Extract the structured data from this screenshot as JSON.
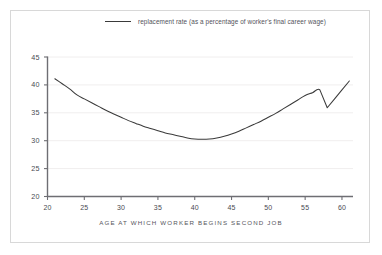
{
  "figure": {
    "border_color": "#d8d8d8",
    "background": "#ffffff"
  },
  "legend": {
    "position": "top-center",
    "swatch_icon": "line-swatch",
    "label": "replacement rate (as a percentage of worker's final career wage)",
    "line_color": "#3a3a3a"
  },
  "axes": {
    "xlabel": "AGE AT WHICH WORKER BEGINS SECOND JOB",
    "ylabel": "",
    "x_ticks": [
      "20",
      "25",
      "30",
      "35",
      "40",
      "45",
      "50",
      "55",
      "60"
    ],
    "y_ticks": [
      "20",
      "25",
      "30",
      "35",
      "40",
      "45"
    ],
    "axis_color": "#6e6e73",
    "grid_color": "#f0eeee",
    "tick_text_color": "#4a4a52"
  },
  "chart_data": {
    "type": "line",
    "title": "",
    "subtitle": "",
    "xlabel": "AGE AT WHICH WORKER BEGINS SECOND JOB",
    "ylabel": "",
    "xlim": [
      20,
      61.5
    ],
    "ylim": [
      20,
      45
    ],
    "xticks": [
      20,
      25,
      30,
      35,
      40,
      45,
      50,
      55,
      60
    ],
    "yticks": [
      20,
      25,
      30,
      35,
      40,
      45
    ],
    "grid": "horizontal",
    "legend_position": "top-center",
    "series": [
      {
        "name": "replacement rate (as a percentage of worker's final career wage)",
        "color": "#3a3a3a",
        "x": [
          21,
          22,
          23,
          24,
          25,
          26,
          27,
          28,
          29,
          30,
          31,
          32,
          33,
          34,
          35,
          36,
          37,
          38,
          39,
          40,
          41,
          42,
          43,
          44,
          45,
          46,
          47,
          48,
          49,
          50,
          51,
          52,
          53,
          54,
          55,
          56,
          57,
          58,
          59,
          60,
          61
        ],
        "values": [
          41.1,
          40.2,
          39.3,
          38.2,
          37.5,
          36.8,
          36.1,
          35.4,
          34.8,
          34.2,
          33.6,
          33.1,
          32.6,
          32.2,
          31.8,
          31.4,
          31.1,
          30.8,
          30.5,
          30.3,
          30.25,
          30.3,
          30.5,
          30.8,
          31.2,
          31.7,
          32.3,
          32.9,
          33.5,
          34.2,
          34.9,
          35.7,
          36.5,
          37.3,
          38.1,
          38.6,
          39.1,
          35.9,
          37.5,
          39.1,
          40.7
        ]
      }
    ],
    "annotations": [
      {
        "text": "minimum replacement rate near age 41",
        "x": 41,
        "y": 30.25
      },
      {
        "text": "local peak at age 57",
        "x": 57,
        "y": 39.1
      },
      {
        "text": "drop at age 58",
        "x": 58,
        "y": 35.9
      }
    ]
  }
}
